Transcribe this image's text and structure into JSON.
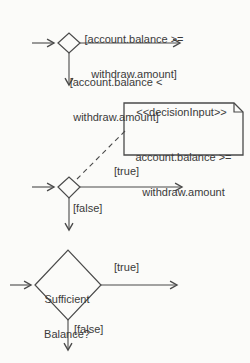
{
  "figure": {
    "background": "#fbfbf9",
    "line_color": "#4a4a4a",
    "text_color": "#3a3a3a"
  },
  "top_branch": {
    "true_guard": [
      "[account.balance >=",
      "withdraw.amount]"
    ],
    "false_guard": [
      "[account.balance <",
      "withdraw.amount]"
    ]
  },
  "note": {
    "stereotype": "<<decisionInput>>",
    "body": [
      "account.balance >=",
      "withdraw.amount"
    ]
  },
  "middle_branch": {
    "true_guard": "[true]",
    "false_guard": "[false]"
  },
  "bottom_branch": {
    "question": [
      "Sufficient",
      "Balance?"
    ],
    "true_guard": "[true]",
    "false_guard": "[false]"
  }
}
